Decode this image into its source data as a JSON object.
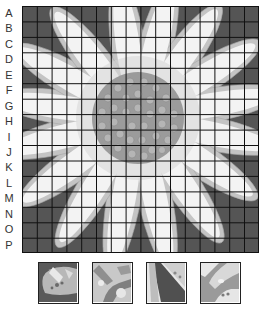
{
  "worksheet": {
    "subject": "daisy flower grid drawing",
    "rows": [
      "A",
      "B",
      "C",
      "D",
      "E",
      "F",
      "G",
      "H",
      "I",
      "J",
      "K",
      "L",
      "M",
      "N",
      "O",
      "P"
    ],
    "columns_count": 16,
    "thumbnails_count": 4
  },
  "colors": {
    "background_dark": "#555555",
    "petal_white": "#f3f3f3",
    "petal_shadow": "#c4c4c4",
    "center": "#9b9b9b",
    "center_dot": "#b5b5b5",
    "grid_line": "#111111"
  }
}
